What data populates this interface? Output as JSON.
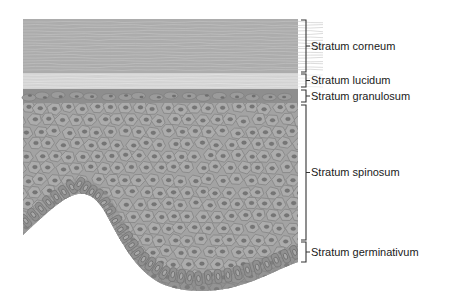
{
  "figure": {
    "layers": [
      {
        "id": "corneum",
        "label": "Stratum corneum",
        "bracket": [
          20,
          72
        ],
        "text_y": 46
      },
      {
        "id": "lucidum",
        "label": "Stratum lucidum",
        "bracket": [
          74,
          87
        ],
        "text_y": 81
      },
      {
        "id": "granulosum",
        "label": "Stratum granulosum",
        "bracket": [
          90,
          102
        ],
        "text_y": 98
      },
      {
        "id": "spinosum",
        "label": "Stratum spinosum",
        "bracket": [
          105,
          240
        ],
        "text_y": 172
      },
      {
        "id": "germinativum",
        "label": "Stratum germinativum",
        "bracket": [
          242,
          262
        ],
        "text_y": 252
      }
    ],
    "colors": {
      "corneum": "#a9a9a9",
      "lucidum": "#d2d2d2",
      "granulosum": "#8f8f8f",
      "spinosum": "#a0a0a0",
      "germinativum": "#858585",
      "cell_border": "#7a7a7a",
      "nucleus": "#707070",
      "bracket": "#333333"
    }
  }
}
